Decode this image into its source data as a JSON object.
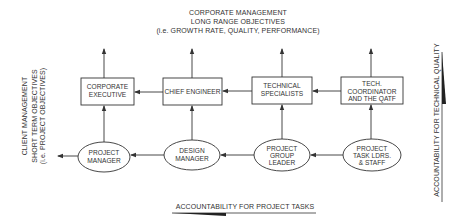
{
  "top_header": {
    "line1": "CORPORATE MANAGEMENT",
    "line2": "LONG RANGE OBJECTIVES",
    "line3": "(i.e. GROWTH RATE, QUALITY, PERFORMANCE)"
  },
  "left_label": {
    "line1": "CLIENT MANAGEMENT",
    "line2": "SHORT TERM OBJECTIVES",
    "line3": "(i.e. PROJECT OBJECTIVES)"
  },
  "right_label": "ACCOUNTABILITY FOR TECHNICAL QUALITY",
  "bottom_label": "ACCOUNTABILITY FOR PROJECT TASKS",
  "boxes": [
    {
      "line1": "CORPORATE",
      "line2": "EXECUTIVE"
    },
    {
      "line1": "CHIEF ENGINEER"
    },
    {
      "line1": "TECHNICAL",
      "line2": "SPECIALISTS"
    },
    {
      "line1": "TECH.",
      "line2": "COORDINATOR",
      "line3": "AND THE QATF"
    }
  ],
  "ellipses": [
    {
      "line1": "PROJECT",
      "line2": "MANAGER"
    },
    {
      "line1": "DESIGN",
      "line2": "MANAGER"
    },
    {
      "line1": "PROJECT",
      "line2": "GROUP",
      "line3": "LEADER"
    },
    {
      "line1": "PROJECT",
      "line2": "TASK LDRS.",
      "line3": "& STAFF"
    }
  ],
  "colors": {
    "line": "#3a3a3a",
    "background": "#ffffff"
  }
}
